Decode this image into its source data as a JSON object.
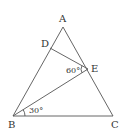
{
  "diagram": {
    "type": "geometry-triangle",
    "points": {
      "A": {
        "label": "A",
        "x": 63,
        "y": 27
      },
      "B": {
        "label": "B",
        "x": 13,
        "y": 116
      },
      "C": {
        "label": "C",
        "x": 113,
        "y": 116
      },
      "D": {
        "label": "D",
        "x": 50,
        "y": 48
      },
      "E": {
        "label": "E",
        "x": 88,
        "y": 69
      }
    },
    "segments": [
      "AB",
      "BC",
      "CA",
      "DE",
      "BE"
    ],
    "angles": [
      {
        "label": "60°",
        "at": "E",
        "between": [
          "ED",
          "EB"
        ]
      },
      {
        "label": "30°",
        "at": "B",
        "between": [
          "BC",
          "BE"
        ]
      }
    ],
    "line_color": "#555555",
    "text_color": "#333333"
  }
}
